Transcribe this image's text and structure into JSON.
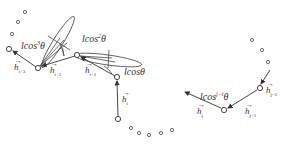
{
  "figure": {
    "labels": {
      "lcos3": {
        "base": "lcos",
        "exp": "3",
        "tail": "θ"
      },
      "lcos2": {
        "base": "lcos",
        "exp": "2",
        "tail": "θ"
      },
      "lcos1": {
        "base": "lcosθ"
      },
      "lcosj": {
        "base": "lcos",
        "exp": "j−i",
        "tail": "θ"
      }
    },
    "vectors": {
      "h_i3": {
        "base": "h",
        "sub": "i+3",
        "arrow": "→"
      },
      "h_i2": {
        "base": "h",
        "sub": "i+2",
        "arrow": "→"
      },
      "h_i1": {
        "base": "h",
        "sub": "i+1",
        "arrow": "→"
      },
      "h_i": {
        "base": "h",
        "sub": "i",
        "arrow": "→"
      },
      "h_j2": {
        "base": "h",
        "sub": "j−2",
        "arrow": "→"
      },
      "h_j1": {
        "base": "h",
        "sub": "j−1",
        "arrow": "→"
      },
      "h_j": {
        "base": "h",
        "sub": "j",
        "arrow": "→"
      }
    },
    "colors": {
      "stroke": "#444444",
      "text": "#333333"
    }
  }
}
